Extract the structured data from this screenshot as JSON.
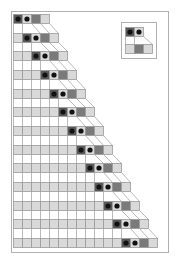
{
  "figure": {
    "steps": 13,
    "frame": {
      "x": 11,
      "y": 11,
      "width": 157,
      "height": 241
    },
    "grid": {
      "x0": 13,
      "y0": 14,
      "cell_w": 9,
      "cell_h": 9,
      "row_pitch": 18.67
    },
    "colors": {
      "background": "#ffffff",
      "frame": "#b0b0b0",
      "cell_light": "#d9d9d9",
      "cell_dark": "#595959",
      "cell_mid": "#7a7a7a",
      "cell_border": "#9a9a9a",
      "head_dot": "#111111",
      "connector": "#a8a8a8"
    },
    "row_pattern": [
      "light...",
      "dark+dot",
      "light+dot",
      "mid",
      "light"
    ],
    "rule_inset": {
      "box": {
        "x": 121,
        "y": 22,
        "width": 35,
        "height": 36
      },
      "top_cells": [
        {
          "x": 125,
          "y": 27,
          "fill": "dark",
          "dot": true
        },
        {
          "x": 134,
          "y": 27,
          "fill": "light",
          "dot": true
        }
      ],
      "bottom_cells": [
        {
          "x": 125,
          "y": 44,
          "fill": "light",
          "dot": false
        },
        {
          "x": 134,
          "y": 44,
          "fill": "mid",
          "dot": false
        },
        {
          "x": 143,
          "y": 44,
          "fill": "light",
          "dot": false
        }
      ],
      "connector": {
        "x1": 143,
        "y1": 36,
        "x2": 152,
        "y2": 44
      }
    }
  }
}
